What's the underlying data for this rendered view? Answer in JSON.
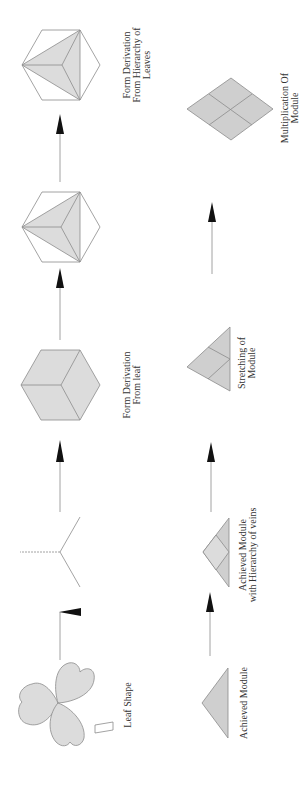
{
  "diagram": {
    "orientation": "rotated -90deg (reads bottom to top)",
    "colors": {
      "fill": "#dcdcdc",
      "fill_dark": "#cfcfcf",
      "stroke": "#8c8c8c",
      "arrow": "#111111",
      "text": "#333333"
    },
    "top_row": [
      {
        "id": "leaf",
        "label_lines": [
          "Leaf Shape"
        ]
      },
      {
        "id": "veins",
        "label_lines": []
      },
      {
        "id": "cube",
        "label_lines": [
          "Form Derivation",
          "From leaf"
        ]
      },
      {
        "id": "hex-triangle-1",
        "label_lines": []
      },
      {
        "id": "hex-triangle-2",
        "label_lines": [
          "Form Derivation",
          "From Hierarchy of",
          "Leaves"
        ]
      }
    ],
    "bottom_row": [
      {
        "id": "achieved-module",
        "label_lines": [
          "Achieved Module"
        ]
      },
      {
        "id": "module-veins",
        "label_lines": [
          "Achieved Module",
          "with Hierarchy of veins"
        ]
      },
      {
        "id": "stretching",
        "label_lines": [
          "Stretching of",
          "Module"
        ]
      },
      {
        "id": "multiplication",
        "label_lines": [
          "Multiplication Of",
          "Module"
        ]
      }
    ],
    "arrows": [
      {
        "from": "leaf",
        "to": "veins"
      },
      {
        "from": "veins",
        "to": "cube"
      },
      {
        "from": "cube",
        "to": "hex-triangle-1"
      },
      {
        "from": "hex-triangle-1",
        "to": "hex-triangle-2"
      },
      {
        "from": "achieved-module",
        "to": "module-veins"
      },
      {
        "from": "module-veins",
        "to": "stretching"
      },
      {
        "from": "stretching",
        "to": "multiplication"
      }
    ]
  }
}
